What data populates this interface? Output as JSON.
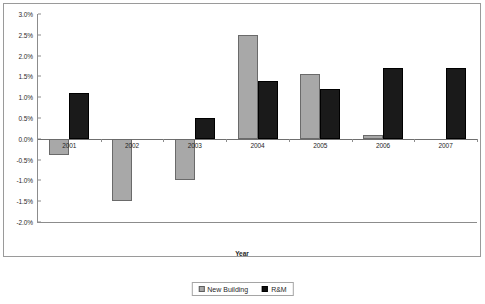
{
  "chart_data": {
    "type": "bar",
    "title": "",
    "xlabel": "Year",
    "ylabel": "",
    "categories": [
      "2001",
      "2002",
      "2003",
      "2004",
      "2005",
      "2006",
      "2007"
    ],
    "series": [
      {
        "name": "New Building",
        "color": "#a8a8a8",
        "values": [
          -0.4,
          -1.5,
          -1.0,
          2.5,
          1.55,
          0.1,
          0.0
        ]
      },
      {
        "name": "R&M",
        "color": "#1a1a1a",
        "values": [
          1.1,
          0.0,
          0.5,
          1.4,
          1.2,
          1.7,
          1.7
        ]
      }
    ],
    "ylim": [
      -2.0,
      3.0
    ],
    "ytick_step": 0.5,
    "ytick_labels": [
      "3.0%",
      "2.5%",
      "2.0%",
      "1.5%",
      "1.0%",
      "0.5%",
      "0.0%",
      "-0.5%",
      "-1.0%",
      "-1.5%",
      "-2.0%"
    ],
    "ytick_values": [
      3.0,
      2.5,
      2.0,
      1.5,
      1.0,
      0.5,
      0.0,
      -0.5,
      -1.0,
      -1.5,
      -2.0
    ],
    "grid": false,
    "legend_position": "bottom-center",
    "value_suffix": "%"
  },
  "legend": {
    "entries": [
      {
        "label": "New Building",
        "swatch": "newbuilding"
      },
      {
        "label": "R&M",
        "swatch": "rm"
      }
    ]
  },
  "axis": {
    "x_title": "Year"
  }
}
